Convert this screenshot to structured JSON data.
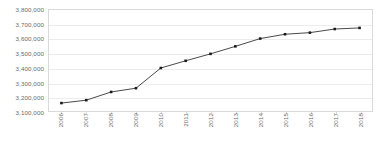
{
  "chart_data": {
    "type": "line",
    "title": "",
    "subtitle": "",
    "xlabel": "",
    "ylabel": "",
    "categories": [
      "2006",
      "2007",
      "2008",
      "2009",
      "2010",
      "2011",
      "2012",
      "2013",
      "2014",
      "2015",
      "2016",
      "2017",
      "2018"
    ],
    "values": [
      3155000,
      3175000,
      3232000,
      3258000,
      3398000,
      3448000,
      3496000,
      3548000,
      3602000,
      3632000,
      3643000,
      3668000,
      3676000
    ],
    "series": [
      {
        "name": "",
        "values": [
          3155000,
          3175000,
          3232000,
          3258000,
          3398000,
          3448000,
          3496000,
          3548000,
          3602000,
          3632000,
          3643000,
          3668000,
          3676000
        ]
      }
    ],
    "ylim": [
      3100000,
      3800000
    ],
    "ytick_step": 100000,
    "ytick_labels": [
      "3,800,000",
      "3,700,000",
      "3,600,000",
      "3,500,000",
      "3,400,000",
      "3,300,000",
      "3,200,000",
      "3,100,000"
    ],
    "ytick_values": [
      3800000,
      3700000,
      3600000,
      3500000,
      3400000,
      3300000,
      3200000,
      3100000
    ],
    "grid": true,
    "legend": false,
    "legend_position": "none",
    "marker": "square",
    "xtick_rotation": 90
  },
  "style": {
    "line_color": "#4a4a4a",
    "marker_color": "#1a1a1a",
    "grid_color": "#ececec",
    "frame_color": "#d9d9d9",
    "tick_label_color": "#6b6b6b",
    "background": "#ffffff"
  }
}
